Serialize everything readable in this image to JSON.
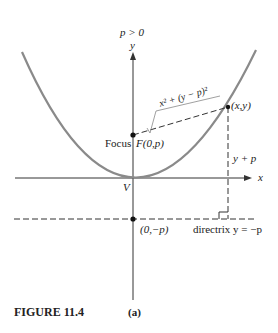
{
  "figure": {
    "caption": "FIGURE 11.4",
    "panel": "(a)",
    "condition": "p > 0",
    "axes": {
      "x_label": "x",
      "y_label": "y"
    },
    "labels": {
      "vertex": "V",
      "focus_word": "Focus",
      "focus_point": "F(0,p)",
      "point": "(x,y)",
      "distance_to_focus": "√(x² + (y − p)²)",
      "distance_radicand": "x² + (y − p)²",
      "distance_to_directrix": "y + p",
      "directrix_point": "(0,−p)",
      "directrix_label": "directrix y = −p"
    },
    "colors": {
      "parabola": "#8a8a8a",
      "lines": "#222222",
      "background": "#ffffff"
    }
  }
}
